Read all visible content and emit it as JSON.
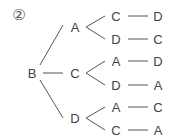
{
  "problem_number": "②",
  "tree": {
    "root": "B",
    "level1": [
      "A",
      "C",
      "D"
    ],
    "level2": [
      "C",
      "D",
      "A",
      "D",
      "A",
      "C"
    ],
    "level3": [
      "D",
      "C",
      "D",
      "A",
      "C",
      "A"
    ]
  },
  "paths": [
    [
      "B",
      "A",
      "C",
      "D"
    ],
    [
      "B",
      "A",
      "D",
      "C"
    ],
    [
      "B",
      "C",
      "A",
      "D"
    ],
    [
      "B",
      "C",
      "D",
      "A"
    ],
    [
      "B",
      "D",
      "A",
      "C"
    ],
    [
      "B",
      "D",
      "C",
      "A"
    ]
  ],
  "colors": {
    "line": "#555555",
    "text": "#444444"
  }
}
